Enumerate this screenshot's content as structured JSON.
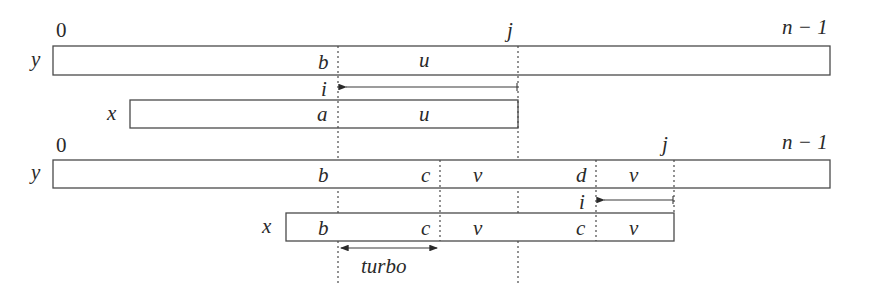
{
  "diagram": {
    "top": {
      "index_start": "0",
      "index_j": "j",
      "index_end": "n − 1",
      "text_y_label": "y",
      "text_y_cells": [
        "b",
        "u"
      ],
      "shift_label": "i",
      "pattern_x_label": "x",
      "pattern_x_cells": [
        "a",
        "u"
      ]
    },
    "bottom": {
      "index_start": "0",
      "index_j": "j",
      "index_end": "n − 1",
      "text_y_label": "y",
      "text_y_cells": [
        "b",
        "c",
        "v",
        "d",
        "v"
      ],
      "shift_label": "i",
      "pattern_x_label": "x",
      "pattern_x_cells": [
        "b",
        "c",
        "v",
        "c",
        "v"
      ],
      "turbo_label": "turbo"
    }
  }
}
